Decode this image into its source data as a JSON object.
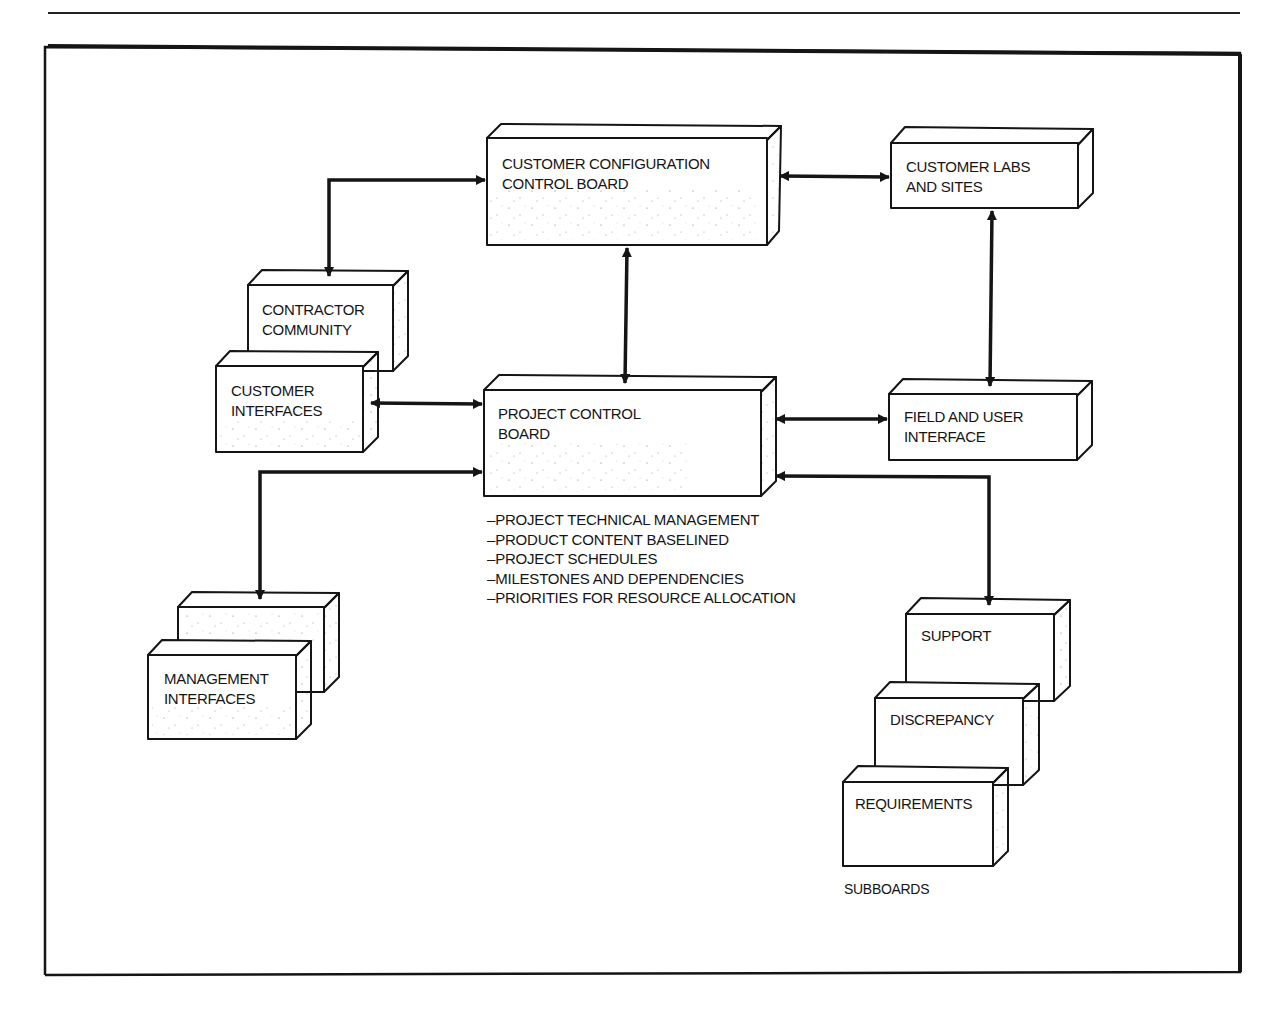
{
  "diagram": {
    "boxes": [
      {
        "id": "customer-config-board",
        "lines": [
          "CUSTOMER CONFIGURATION",
          "CONTROL BOARD"
        ]
      },
      {
        "id": "customer-labs",
        "lines": [
          "CUSTOMER LABS",
          "AND SITES"
        ]
      },
      {
        "id": "contractor-community",
        "lines": [
          "CONTRACTOR",
          "COMMUNITY"
        ]
      },
      {
        "id": "customer-interfaces",
        "lines": [
          "CUSTOMER",
          "INTERFACES"
        ]
      },
      {
        "id": "project-control-board",
        "lines": [
          "PROJECT CONTROL",
          "BOARD"
        ]
      },
      {
        "id": "field-user-interface",
        "lines": [
          "FIELD AND USER",
          "INTERFACE"
        ]
      },
      {
        "id": "management-interfaces",
        "lines": [
          "MANAGEMENT",
          "INTERFACES"
        ]
      },
      {
        "id": "support",
        "lines": [
          "SUPPORT"
        ]
      },
      {
        "id": "discrepancy",
        "lines": [
          "DISCREPANCY"
        ]
      },
      {
        "id": "requirements",
        "lines": [
          "REQUIREMENTS"
        ]
      }
    ],
    "pcb_responsibilities": [
      "PROJECT TECHNICAL MANAGEMENT",
      "PRODUCT CONTENT BASELINED",
      "PROJECT SCHEDULES",
      "MILESTONES AND DEPENDENCIES",
      "PRIORITIES FOR RESOURCE ALLOCATION"
    ],
    "subboards_label": "SUBBOARDS",
    "connections": [
      {
        "from": "customer-config-board",
        "to": "contractor-community",
        "type": "bidirectional"
      },
      {
        "from": "customer-config-board",
        "to": "customer-labs",
        "type": "bidirectional"
      },
      {
        "from": "customer-config-board",
        "to": "project-control-board",
        "type": "bidirectional"
      },
      {
        "from": "customer-labs",
        "to": "field-user-interface",
        "type": "bidirectional"
      },
      {
        "from": "customer-interfaces",
        "to": "project-control-board",
        "type": "bidirectional"
      },
      {
        "from": "project-control-board",
        "to": "field-user-interface",
        "type": "bidirectional"
      },
      {
        "from": "project-control-board",
        "to": "management-interfaces",
        "type": "bidirectional"
      },
      {
        "from": "project-control-board",
        "to": "support",
        "type": "bidirectional"
      }
    ]
  },
  "colors": {
    "ink": "#151515",
    "background": "#ffffff"
  }
}
